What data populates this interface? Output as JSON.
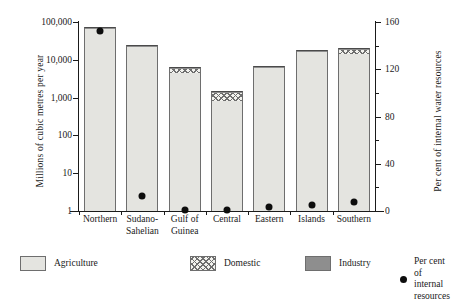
{
  "chart_data": {
    "type": "bar",
    "title": "",
    "subtitle": "",
    "categories": [
      "Northern",
      "Sudano-\nSahelian",
      "Gulf of\nGuinea",
      "Central",
      "Eastern",
      "Islands",
      "Southern"
    ],
    "xlabel": "",
    "ylabel": "Millions of cubic metres per year",
    "ylabel_secondary": "Per cent of internal water resources",
    "yscale": "log",
    "ylim": [
      1,
      100000
    ],
    "ytick_labels": [
      "1",
      "10",
      "100",
      "1,000",
      "10,000",
      "100,000"
    ],
    "ytick_values": [
      1,
      10,
      100,
      1000,
      10000,
      100000
    ],
    "ylim_secondary": [
      0,
      160
    ],
    "ytick_labels_secondary": [
      "0",
      "40",
      "80",
      "120",
      "160"
    ],
    "ytick_values_secondary": [
      0,
      40,
      80,
      120,
      160
    ],
    "ytick_minor_secondary": [
      20,
      60,
      100,
      140
    ],
    "grid": false,
    "legend_position": "below",
    "stacked": true,
    "series": [
      {
        "name": "Agriculture",
        "color": "#e4e4e0",
        "pattern": "solid-light",
        "values": [
          69000,
          24000,
          4600,
          800,
          6100,
          17500,
          14500
        ]
      },
      {
        "name": "Domestic",
        "color": "#f2f2ee",
        "pattern": "cross-hatch",
        "values": [
          2500,
          600,
          1700,
          600,
          800,
          400,
          5000
        ]
      },
      {
        "name": "Industry",
        "color": "#8e8e8e",
        "pattern": "solid-dark",
        "values": [
          2500,
          300,
          300,
          100,
          120,
          200,
          600
        ]
      }
    ],
    "totals": [
      74000,
      24900,
      6600,
      1500,
      7020,
      18100,
      20100
    ],
    "overlay_series": {
      "name": "Per cent of internal resources",
      "marker": "circle",
      "color": "#0d0d0d",
      "axis": "secondary",
      "values": [
        152,
        13,
        1,
        1,
        3,
        5,
        8
      ]
    }
  },
  "legend": {
    "items": [
      {
        "label": "Agriculture",
        "swatch": "agriculture-swatch"
      },
      {
        "label": "Domestic",
        "swatch": "domestic-swatch"
      },
      {
        "label": "Industry",
        "swatch": "industry-swatch"
      },
      {
        "label": "Per cent of\ninternal resources",
        "swatch": "percent-dot-marker"
      }
    ]
  }
}
